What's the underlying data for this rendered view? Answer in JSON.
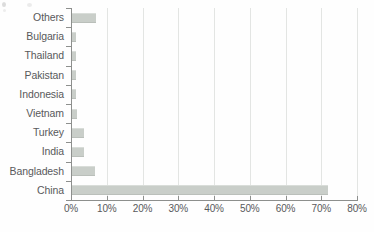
{
  "chart_data": {
    "type": "bar",
    "orientation": "horizontal",
    "title": "",
    "subtitle": "",
    "xlabel": "",
    "ylabel": "",
    "categories": [
      "Others",
      "Bulgaria",
      "Thailand",
      "Pakistan",
      "Indonesia",
      "Vietnam",
      "Turkey",
      "India",
      "Bangladesh",
      "China"
    ],
    "values": [
      6.7,
      1.0,
      1.1,
      1.2,
      1.2,
      1.5,
      3.4,
      3.4,
      6.5,
      71.5
    ],
    "xlim": [
      0,
      80
    ],
    "xticks": [
      0,
      10,
      20,
      30,
      40,
      50,
      60,
      70,
      80
    ],
    "xtick_labels": [
      "0%",
      "10%",
      "20%",
      "30%",
      "40%",
      "50%",
      "60%",
      "70%",
      "80%"
    ],
    "grid": true,
    "grid_axis": "x",
    "legend": false,
    "bar_color": "#c9cec9",
    "axis_color": "#8d8f8d",
    "gridline_color": "#e3e5e3",
    "text_color": "#58595b"
  }
}
